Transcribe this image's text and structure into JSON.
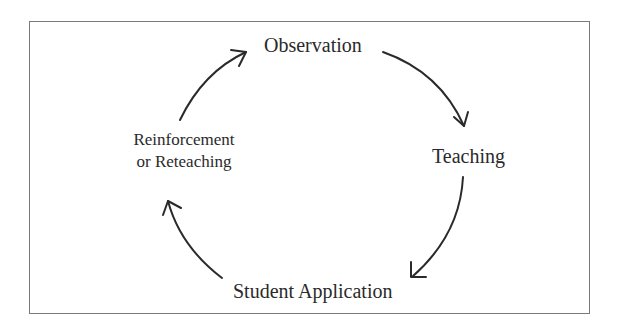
{
  "diagram": {
    "type": "cycle",
    "nodes": [
      {
        "id": "observation",
        "label": "Observation"
      },
      {
        "id": "teaching",
        "label": "Teaching"
      },
      {
        "id": "student_application",
        "label": "Student Application"
      },
      {
        "id": "reinforcement",
        "label_line1": "Reinforcement",
        "label_line2": "or Reteaching"
      }
    ],
    "edges": [
      {
        "from": "observation",
        "to": "teaching"
      },
      {
        "from": "teaching",
        "to": "student_application"
      },
      {
        "from": "student_application",
        "to": "reinforcement"
      },
      {
        "from": "reinforcement",
        "to": "observation"
      }
    ],
    "colors": {
      "border": "#7a7a7a",
      "arrow": "#2a2a2a",
      "text": "#2a2a2a",
      "background": "#ffffff"
    }
  }
}
